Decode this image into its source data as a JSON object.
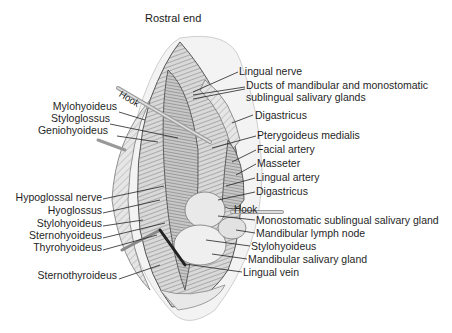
{
  "diagram": {
    "title": "Rostral end",
    "hook_labels": [
      "Hook",
      "Hook"
    ],
    "labels_left": [
      {
        "text": "Mylohyoideus",
        "x": 117,
        "y": 105
      },
      {
        "text": "Styloglossus",
        "x": 107,
        "y": 117
      },
      {
        "text": "Geniohyoideus",
        "x": 107,
        "y": 130
      },
      {
        "text": "Hypoglossal nerve",
        "x": 102,
        "y": 194
      },
      {
        "text": "Hyoglossus",
        "x": 102,
        "y": 208
      },
      {
        "text": "Stylohyoideus",
        "x": 102,
        "y": 221
      },
      {
        "text": "Sternohyoideus",
        "x": 102,
        "y": 233
      },
      {
        "text": "Thyrohyoideus",
        "x": 102,
        "y": 245
      },
      {
        "text": "Sternothyroideus",
        "x": 117,
        "y": 273
      }
    ],
    "labels_right": [
      {
        "text": "Lingual nerve",
        "x": 239,
        "y": 67
      },
      {
        "text": "Ducts of mandibular and monostomatic",
        "x": 246,
        "y": 81
      },
      {
        "text": "sublingual salivary glands",
        "x": 246,
        "y": 93
      },
      {
        "text": "Digastricus",
        "x": 255,
        "y": 110
      },
      {
        "text": "Pterygoideus medialis",
        "x": 257,
        "y": 131
      },
      {
        "text": "Facial artery",
        "x": 257,
        "y": 145
      },
      {
        "text": "Masseter",
        "x": 257,
        "y": 159
      },
      {
        "text": "Lingual artery",
        "x": 256,
        "y": 173
      },
      {
        "text": "Digastricus",
        "x": 256,
        "y": 187
      },
      {
        "text": "Monostomatic sublingual salivary gland",
        "x": 256,
        "y": 214
      },
      {
        "text": "Mandibular lymph node",
        "x": 256,
        "y": 227
      },
      {
        "text": "Stylohyoideus",
        "x": 251,
        "y": 241
      },
      {
        "text": "Mandibular salivary gland",
        "x": 248,
        "y": 254
      },
      {
        "text": "Lingual vein",
        "x": 243,
        "y": 267
      }
    ]
  }
}
